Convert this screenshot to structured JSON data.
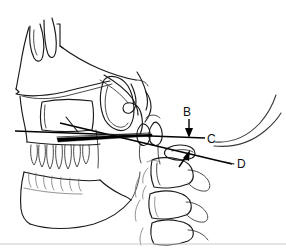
{
  "figure": {
    "type": "cephalometric-tracing",
    "background_color": "#ffffff",
    "line_color": "#1a1a1a",
    "width": 286,
    "height": 248
  },
  "labels": [
    {
      "id": "B",
      "text": "B",
      "x": 186,
      "y": 115,
      "annotation": "downward arrow to horizontal reference line"
    },
    {
      "id": "C",
      "text": "C",
      "x": 209,
      "y": 142,
      "annotation": "landmark at right end of horizontal reference line"
    },
    {
      "id": "D",
      "text": "D",
      "x": 238,
      "y": 167,
      "annotation": "leader line from oblique reference line"
    }
  ],
  "arrows": [
    {
      "id": "arrow-b",
      "from_x": 189,
      "from_y": 119,
      "to_x": 189,
      "to_y": 137,
      "direction": "down",
      "points_to": "B"
    },
    {
      "id": "arrow-vertebra",
      "from_x": 180,
      "from_y": 166,
      "to_x": 189,
      "to_y": 152,
      "direction": "up-right",
      "points_to": "cervical vertebra"
    }
  ],
  "anatomy": [
    {
      "name": "frontal-sinus",
      "region": "upper-left"
    },
    {
      "name": "nasal-bone",
      "region": "upper-left"
    },
    {
      "name": "orbital-floor",
      "region": "upper-middle"
    },
    {
      "name": "maxillary-sinus",
      "region": "middle-left"
    },
    {
      "name": "pterygomaxillary-fissure",
      "region": "middle"
    },
    {
      "name": "sella-turcica",
      "region": "middle"
    },
    {
      "name": "maxillary-dentition",
      "region": "lower-left"
    },
    {
      "name": "mandibular-dentition",
      "region": "lower-left"
    },
    {
      "name": "mandible-body",
      "region": "lower-left"
    },
    {
      "name": "cervical-vertebrae",
      "region": "lower-right"
    },
    {
      "name": "posterior-pharyngeal-wall",
      "region": "right"
    },
    {
      "name": "soft-palate-outline",
      "region": "right"
    }
  ],
  "reference_lines": [
    {
      "name": "horizontal-reference-line",
      "x1": 15,
      "y1": 131,
      "x2": 208,
      "y2": 138
    },
    {
      "name": "oblique-reference-line",
      "x1": 60,
      "y1": 124,
      "x2": 232,
      "y2": 164
    },
    {
      "name": "palatal-plane-wedge",
      "x1": 30,
      "y1": 140,
      "x2": 150,
      "y2": 134
    }
  ]
}
